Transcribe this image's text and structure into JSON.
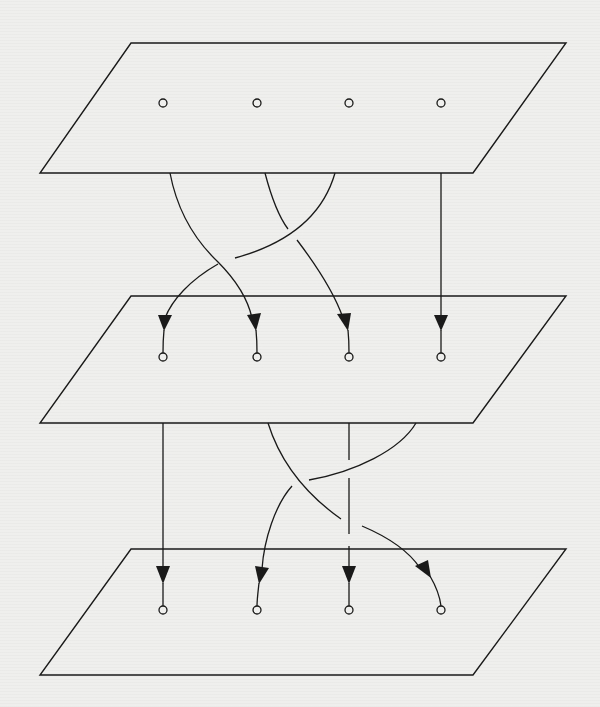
{
  "figure": {
    "colors": {
      "background": "#efefed",
      "ink": "#1a1a1a"
    },
    "planes": [
      {
        "id": "plane-1",
        "label": "top plane",
        "points": 4
      },
      {
        "id": "plane-2",
        "label": "middle plane",
        "points": 4
      },
      {
        "id": "plane-3",
        "label": "bottom plane",
        "points": 4
      }
    ],
    "point_columns": 4,
    "layers": [
      {
        "id": "upper-braid",
        "from": "plane-1",
        "to": "plane-2",
        "permutation": [
          2,
          3,
          1,
          4
        ],
        "crossings": 2
      },
      {
        "id": "lower-braid",
        "from": "plane-2",
        "to": "plane-3",
        "permutation": [
          1,
          4,
          3,
          2
        ],
        "crossings": 3
      }
    ]
  }
}
